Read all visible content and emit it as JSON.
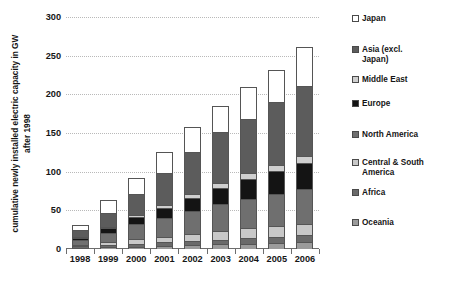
{
  "chart_data": {
    "type": "bar",
    "subtype": "stacked-vertical",
    "title": "",
    "xlabel": "",
    "ylabel": "cumulative newly installed electric capacity in GW after 1998",
    "ylim": [
      0,
      300
    ],
    "ytick_values": [
      0,
      50,
      100,
      150,
      200,
      250,
      300
    ],
    "ytick_labels": [
      "0",
      "50",
      "100",
      "150",
      "200",
      "250",
      "300"
    ],
    "grid": true,
    "grid_axis": "y",
    "legend_position": "right",
    "categories": [
      "1998",
      "1999",
      "2000",
      "2001",
      "2002",
      "2003",
      "2004",
      "2005",
      "2006"
    ],
    "stack_order_bottom_to_top": [
      "Oceania",
      "Africa",
      "Central & South America",
      "North America",
      "Europe",
      "Middle East",
      "Asia (excl. Japan)",
      "Japan"
    ],
    "series": [
      {
        "name": "Oceania",
        "color": "#9b9b9b",
        "values": [
          1,
          2,
          3,
          4,
          5,
          6,
          7,
          8,
          9
        ]
      },
      {
        "name": "Africa",
        "color": "#6a6a6a",
        "values": [
          2,
          3,
          4,
          5,
          5,
          6,
          7,
          8,
          9
        ]
      },
      {
        "name": "Central & South America",
        "color": "#c8c8c8",
        "values": [
          2,
          4,
          6,
          7,
          9,
          11,
          13,
          14,
          15
        ]
      },
      {
        "name": "North America",
        "color": "#6f6f6f",
        "values": [
          6,
          12,
          19,
          24,
          30,
          35,
          38,
          41,
          44
        ],
        "note": "North America appears as two medium-gray bands split by Europe"
      },
      {
        "name": "Europe",
        "color": "#141414",
        "values": [
          3,
          6,
          9,
          13,
          17,
          21,
          26,
          30,
          34
        ]
      },
      {
        "name": "Middle East",
        "color": "#cfcfcf",
        "values": [
          1,
          2,
          3,
          4,
          5,
          6,
          7,
          8,
          9
        ]
      },
      {
        "name": "Asia (excl. Japan)",
        "color": "#5c5c5c",
        "values": [
          9,
          18,
          27,
          42,
          55,
          66,
          70,
          81,
          91
        ]
      },
      {
        "name": "Japan",
        "color": "#ffffff",
        "values": [
          7,
          16,
          21,
          27,
          32,
          34,
          42,
          42,
          50
        ]
      }
    ],
    "totals": [
      31,
      63,
      92,
      126,
      158,
      185,
      210,
      232,
      261
    ],
    "colors": {
      "oceania": "#9b9b9b",
      "africa": "#6a6a6a",
      "central_south_america": "#c8c8c8",
      "north_america": "#6f6f6f",
      "europe": "#141414",
      "middle_east": "#cfcfcf",
      "asia_excl_japan": "#5c5c5c",
      "japan": "#ffffff",
      "axis": "#6d6d6d",
      "gridline": "#b9b9b9",
      "text": "#161616"
    }
  },
  "legend": {
    "items": [
      {
        "label": "Japan",
        "color": "#ffffff"
      },
      {
        "label": "Asia (excl.\nJapan)",
        "color": "#5c5c5c"
      },
      {
        "label": "Middle East",
        "color": "#cfcfcf"
      },
      {
        "label": "Europe",
        "color": "#141414"
      },
      {
        "label": "North America",
        "color": "#6f6f6f"
      },
      {
        "label": "Central & South\nAmerica",
        "color": "#c8c8c8"
      },
      {
        "label": "Africa",
        "color": "#6a6a6a"
      },
      {
        "label": "Oceania",
        "color": "#9b9b9b"
      }
    ]
  }
}
